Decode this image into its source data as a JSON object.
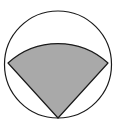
{
  "diagram": {
    "type": "geometry",
    "colors": {
      "background": "#ffffff",
      "stroke": "#1a1a1a",
      "sector_fill": "#a9a9a9"
    },
    "circle": {
      "cx": 58,
      "cy": 64.5,
      "r": 53.5
    },
    "sector": {
      "vertex": [
        58,
        118
      ],
      "left_point": [
        8,
        63
      ],
      "right_point": [
        108,
        63
      ],
      "radius": 74
    }
  }
}
